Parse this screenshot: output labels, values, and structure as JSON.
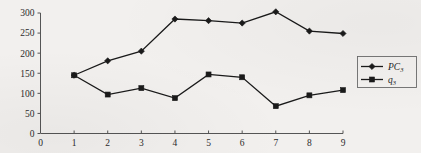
{
  "chart_data": {
    "type": "line",
    "title": "",
    "xlabel": "",
    "ylabel": "",
    "x": [
      1,
      2,
      3,
      4,
      5,
      6,
      7,
      8,
      9
    ],
    "xlim": [
      0,
      9
    ],
    "ylim": [
      0,
      300
    ],
    "xticks": [
      "0",
      "1",
      "2",
      "3",
      "4",
      "5",
      "6",
      "7",
      "8",
      "9"
    ],
    "yticks": [
      "0",
      "50",
      "100",
      "150",
      "200",
      "250",
      "300"
    ],
    "grid": false,
    "legend_position": "right",
    "series": [
      {
        "name": "PC",
        "subscript": "3",
        "marker": "diamond",
        "color": "#1a1a1a",
        "values": [
          145,
          181,
          205,
          285,
          281,
          275,
          303,
          255,
          249
        ]
      },
      {
        "name": "q",
        "subscript": "3",
        "marker": "square",
        "color": "#1a1a1a",
        "values": [
          145,
          97,
          113,
          88,
          147,
          140,
          68,
          95,
          108
        ]
      }
    ]
  }
}
